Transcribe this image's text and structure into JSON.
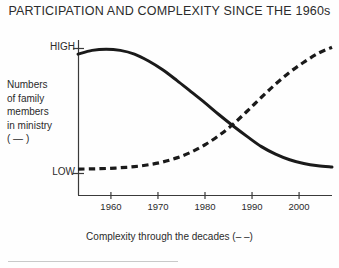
{
  "chart_data": {
    "type": "line",
    "title": "PARTICIPATION AND COMPLEXITY SINCE THE 1960s",
    "xlabel": "Complexity through the decades  (– –)",
    "ylabel_lines": [
      "Numbers",
      "of family",
      "members",
      "in ministry",
      "( — )"
    ],
    "ylabel": "Numbers of family members in ministry ( — )",
    "x_tick_labels": [
      "1960",
      "1970",
      "1980",
      "1990",
      "2000"
    ],
    "x_tick_values": [
      1960,
      1970,
      1980,
      1990,
      2000
    ],
    "y_tick_labels": [
      "HIGH",
      "LOW"
    ],
    "ylim_labels": [
      "LOW",
      "HIGH"
    ],
    "xlim": [
      1953,
      2007
    ],
    "grid": false,
    "legend_position": "inline-in-axis-labels",
    "series": [
      {
        "name": "Numbers of family members in ministry",
        "style": "solid",
        "color": "#1a1a1a",
        "legend_marker": "—",
        "x": [
          1953,
          1956,
          1959,
          1962,
          1965,
          1968,
          1971,
          1974,
          1977,
          1980,
          1983,
          1986,
          1989,
          1992,
          1995,
          1998,
          2001,
          2004,
          2007
        ],
        "y": [
          0.955,
          0.985,
          0.995,
          0.985,
          0.955,
          0.9,
          0.83,
          0.745,
          0.655,
          0.565,
          0.47,
          0.38,
          0.295,
          0.215,
          0.155,
          0.11,
          0.08,
          0.062,
          0.052
        ]
      },
      {
        "name": "Complexity through the decades",
        "style": "dashed",
        "color": "#1a1a1a",
        "legend_marker": "– –",
        "x": [
          1953,
          1956,
          1959,
          1962,
          1965,
          1968,
          1971,
          1974,
          1977,
          1980,
          1983,
          1986,
          1989,
          1992,
          1995,
          1998,
          2001,
          2004,
          2007
        ],
        "y": [
          0.035,
          0.037,
          0.04,
          0.046,
          0.055,
          0.07,
          0.092,
          0.125,
          0.17,
          0.23,
          0.305,
          0.395,
          0.5,
          0.61,
          0.715,
          0.81,
          0.89,
          0.96,
          1.01
        ]
      }
    ],
    "annotations": {
      "crossover_year": 1988,
      "crossover_note": "Solid and dashed curves intersect just before 1990"
    }
  },
  "axes": {
    "y_high_label": "HIGH",
    "y_low_label": "LOW"
  }
}
